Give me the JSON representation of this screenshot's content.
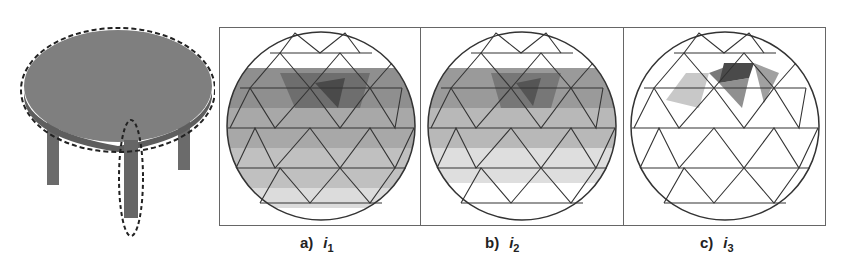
{
  "figure": {
    "object": {
      "name": "round table",
      "highlighted_parts": [
        "tabletop",
        "leg"
      ]
    },
    "panels": [
      {
        "label": "a)",
        "var": "i",
        "sub": "1",
        "shading": "full"
      },
      {
        "label": "b)",
        "var": "i",
        "sub": "2",
        "shading": "partial"
      },
      {
        "label": "c)",
        "var": "i",
        "sub": "3",
        "shading": "top"
      }
    ],
    "colors": {
      "dark": "#555555",
      "mid": "#8a8a8a",
      "light": "#c4c4c4",
      "table": "#7d7d7d",
      "edge": "#333333"
    }
  }
}
